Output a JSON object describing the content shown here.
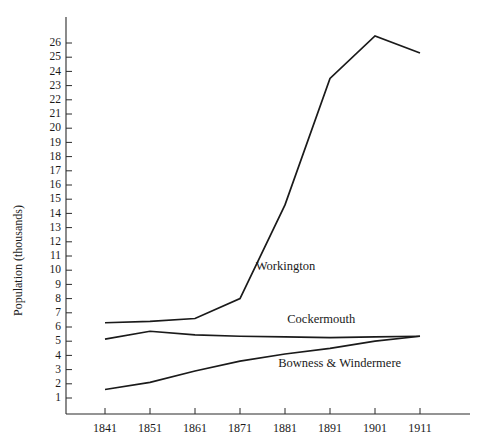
{
  "chart_data": {
    "type": "line",
    "title": "",
    "subtitle": "",
    "xlabel": "",
    "ylabel": "Population (thousands)",
    "x": [
      1841,
      1851,
      1861,
      1871,
      1881,
      1891,
      1901,
      1911
    ],
    "xtick_labels": [
      "1841",
      "1851",
      "1861",
      "1871",
      "1881",
      "1891",
      "1901",
      "1911"
    ],
    "ytick_labels": [
      "1",
      "2",
      "3",
      "4",
      "5",
      "6",
      "7",
      "8",
      "9",
      "10",
      "11",
      "12",
      "13",
      "14",
      "15",
      "16",
      "17",
      "18",
      "19",
      "20",
      "21",
      "22",
      "23",
      "24",
      "25",
      "26"
    ],
    "ylim": [
      0,
      26.8
    ],
    "xlim": [
      1836,
      1918
    ],
    "grid": false,
    "legend": "inline-annotations",
    "line_color": "#1a1a1a",
    "series": [
      {
        "name": "Workington",
        "label": "Workington",
        "values": [
          6.3,
          6.4,
          6.6,
          8.0,
          14.6,
          23.5,
          26.5,
          25.3
        ],
        "label_x": 1874.5,
        "label_y": 10.0
      },
      {
        "name": "Cockermouth",
        "label": "Cockermouth",
        "values": [
          5.15,
          5.7,
          5.45,
          5.35,
          5.3,
          5.25,
          5.3,
          5.35
        ],
        "label_x": 1881.5,
        "label_y": 6.3
      },
      {
        "name": "Bowness & Windermere",
        "label": "Bowness & Windermere",
        "values": [
          1.6,
          2.1,
          2.9,
          3.6,
          4.1,
          4.5,
          5.0,
          5.35
        ],
        "label_x": 1879.5,
        "label_y": 3.2
      }
    ]
  }
}
